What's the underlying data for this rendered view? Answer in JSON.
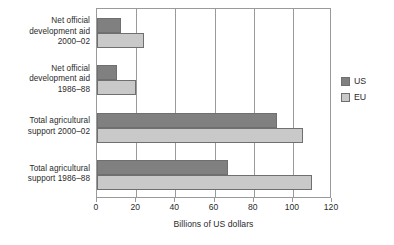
{
  "chart_data": {
    "type": "bar",
    "orientation": "horizontal",
    "title": "",
    "xlabel": "Billions of US dollars",
    "ylabel": "",
    "xlim": [
      0,
      120
    ],
    "xticks": [
      0,
      20,
      40,
      60,
      80,
      100,
      120
    ],
    "grid": true,
    "grid_axis": "x",
    "legend_position": "right",
    "categories": [
      "Net official development aid 2000–02",
      "Net official development aid 1986–88",
      "Total agricultural support 2000–02",
      "Total agricultural support 1986–88"
    ],
    "series": [
      {
        "name": "US",
        "color": "#808080",
        "values": [
          12,
          10,
          92,
          67
        ]
      },
      {
        "name": "EU",
        "color": "#c9c9c9",
        "values": [
          24,
          20,
          105,
          110
        ]
      }
    ]
  },
  "axis": {
    "title": "Billions of US dollars",
    "tick_labels": [
      "0",
      "20",
      "40",
      "60",
      "80",
      "100",
      "120"
    ]
  },
  "categories": [
    {
      "line1": "Net official",
      "line2": "development aid",
      "line3": "2000–02"
    },
    {
      "line1": "Net official",
      "line2": "development aid",
      "line3": "1986–88"
    },
    {
      "line1": "Total agricultural",
      "line2": "support 2000–02",
      "line3": ""
    },
    {
      "line1": "Total agricultural",
      "line2": "support 1986–88",
      "line3": ""
    }
  ],
  "legend": {
    "entries": [
      {
        "label": "US",
        "color": "#808080"
      },
      {
        "label": "EU",
        "color": "#c9c9c9"
      }
    ]
  },
  "colors": {
    "us": "#808080",
    "eu": "#c9c9c9",
    "frame": "#9a9a9a",
    "text": "#2b2b2b",
    "background": "#ffffff"
  }
}
